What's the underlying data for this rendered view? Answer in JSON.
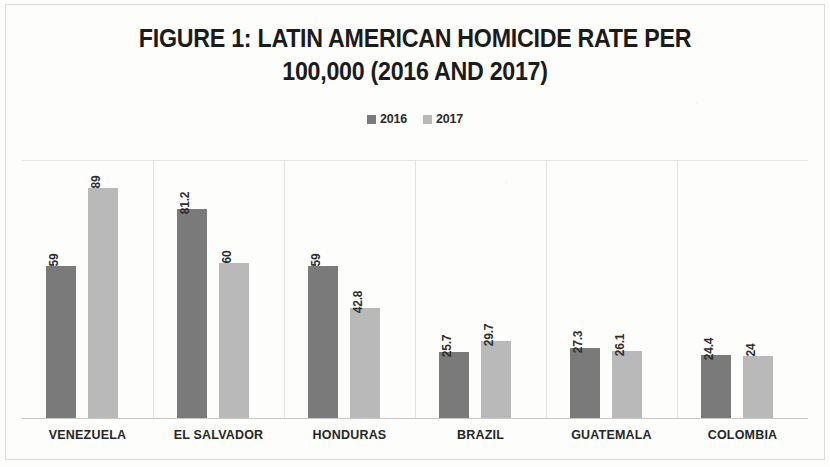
{
  "chart_data": {
    "type": "bar",
    "title": "FIGURE 1: LATIN AMERICAN HOMICIDE RATE PER 100,000 (2016 AND 2017)",
    "title_line1": "FIGURE 1: LATIN AMERICAN HOMICIDE RATE PER",
    "title_line2": "100,000 (2016 AND 2017)",
    "xlabel": "",
    "ylabel": "",
    "ylim": [
      0,
      100
    ],
    "grid": false,
    "legend_position": "top-center",
    "categories": [
      "VENEZUELA",
      "EL SALVADOR",
      "HONDURAS",
      "BRAZIL",
      "GUATEMALA",
      "COLOMBIA"
    ],
    "series": [
      {
        "name": "2016",
        "color": "#7a7a7a",
        "values": [
          59,
          81.2,
          59,
          25.7,
          27.3,
          24.4
        ],
        "labels": [
          "59",
          "81.2",
          "59",
          "25.7",
          "27.3",
          "24.4"
        ]
      },
      {
        "name": "2017",
        "color": "#b9b9b9",
        "values": [
          89,
          60,
          42.8,
          29.7,
          26.1,
          24
        ],
        "labels": [
          "89",
          "60",
          "42.8",
          "29.7",
          "26.1",
          "24"
        ]
      }
    ]
  },
  "legend": {
    "items": [
      {
        "label": "2016",
        "color": "#7a7a7a"
      },
      {
        "label": "2017",
        "color": "#b9b9b9"
      }
    ]
  }
}
